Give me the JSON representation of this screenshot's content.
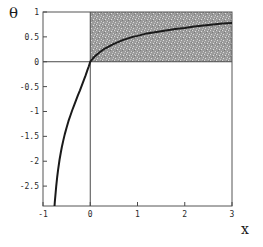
{
  "chart_data": {
    "type": "line",
    "title": "",
    "xlabel": "x",
    "ylabel": "θ",
    "xlim": [
      -1,
      3
    ],
    "ylim": [
      -2.9,
      1
    ],
    "grid": false,
    "legend": null,
    "xticks": [
      -1,
      0,
      1,
      2,
      3
    ],
    "xticklabels": [
      "-1",
      "0",
      "1",
      "2",
      "3"
    ],
    "yticks": [
      1,
      0.5,
      0,
      -0.5,
      -1,
      -1.5,
      -2,
      -2.5
    ],
    "yticklabels": [
      "1",
      "0.5",
      "0",
      "-0.5",
      "-1",
      "-1.5",
      "-2",
      "-2.5"
    ],
    "series": [
      {
        "name": "theta(x)",
        "color": "#1a1a1a",
        "linewidth": 2,
        "x": [
          -0.76,
          -0.75,
          -0.72,
          -0.7,
          -0.68,
          -0.65,
          -0.62,
          -0.6,
          -0.57,
          -0.54,
          -0.5,
          -0.46,
          -0.42,
          -0.38,
          -0.34,
          -0.3,
          -0.26,
          -0.22,
          -0.18,
          -0.14,
          -0.1,
          -0.06,
          -0.03,
          0.0,
          0.05,
          0.1,
          0.15,
          0.2,
          0.3,
          0.4,
          0.5,
          0.6,
          0.7,
          0.8,
          0.9,
          1.0,
          1.2,
          1.4,
          1.6,
          1.8,
          2.0,
          2.2,
          2.4,
          2.6,
          2.8,
          3.0
        ],
        "y": [
          -2.95,
          -2.82,
          -2.5,
          -2.32,
          -2.17,
          -1.97,
          -1.81,
          -1.71,
          -1.58,
          -1.46,
          -1.32,
          -1.19,
          -1.08,
          -0.97,
          -0.87,
          -0.77,
          -0.67,
          -0.58,
          -0.48,
          -0.38,
          -0.28,
          -0.17,
          -0.09,
          0.0,
          0.06,
          0.11,
          0.15,
          0.19,
          0.26,
          0.31,
          0.36,
          0.4,
          0.44,
          0.47,
          0.5,
          0.52,
          0.57,
          0.6,
          0.63,
          0.66,
          0.68,
          0.71,
          0.73,
          0.75,
          0.77,
          0.78
        ]
      }
    ],
    "shaded_region": {
      "name": "shaded-feasible-region",
      "x_range": [
        0,
        3
      ],
      "y_range": [
        0,
        1
      ],
      "fill": "#9a9a9a",
      "pattern": "stipple-noise"
    }
  }
}
